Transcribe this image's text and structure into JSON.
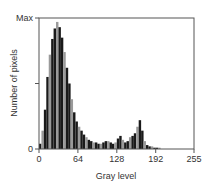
{
  "chart_data": {
    "type": "bar",
    "title": "",
    "xlabel": "Gray level",
    "ylabel": "Number of pixels",
    "xlim": [
      0,
      255
    ],
    "ylim": [
      0,
      100
    ],
    "x_ticks": [
      0,
      64,
      128,
      192,
      255
    ],
    "x_tick_labels": [
      "0",
      "64",
      "128",
      "192",
      "255"
    ],
    "y_ticks": [
      0,
      50,
      100
    ],
    "y_tick_labels": [
      "0",
      "",
      "Max"
    ],
    "grid": false,
    "legend": null,
    "bin_width": 4,
    "x": [
      0,
      4,
      8,
      12,
      16,
      20,
      24,
      28,
      32,
      36,
      40,
      44,
      48,
      52,
      56,
      60,
      64,
      68,
      72,
      76,
      80,
      84,
      88,
      92,
      96,
      100,
      104,
      108,
      112,
      116,
      120,
      124,
      128,
      132,
      136,
      140,
      144,
      148,
      152,
      156,
      160,
      164,
      168,
      172,
      176,
      180,
      184,
      188,
      192,
      196,
      200,
      204,
      208,
      212,
      216,
      220,
      224,
      228,
      232,
      236,
      240,
      244,
      248,
      252
    ],
    "values": [
      4,
      14,
      30,
      55,
      72,
      84,
      92,
      97,
      93,
      85,
      74,
      62,
      50,
      38,
      28,
      21,
      17,
      14,
      11,
      9,
      7,
      6,
      5,
      5,
      4,
      4,
      5,
      6,
      6,
      5,
      4,
      5,
      8,
      10,
      7,
      5,
      6,
      9,
      10,
      12,
      17,
      22,
      14,
      6,
      3,
      2,
      2,
      1,
      1,
      1,
      0,
      0,
      0,
      0,
      0,
      0,
      0,
      0,
      0,
      0,
      0,
      0,
      0,
      0
    ],
    "annotations": []
  },
  "colors": {
    "bar": "#1a1a1a",
    "bar_gap": "#9a9a9a",
    "axis": "#555555",
    "text": "#333333",
    "background": "#ffffff"
  }
}
